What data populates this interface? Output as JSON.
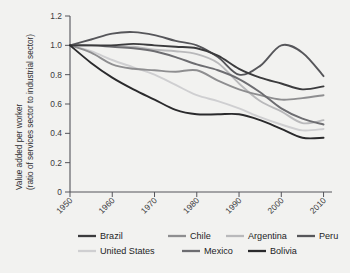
{
  "chart_data": {
    "type": "line",
    "title": "",
    "xlabel": "",
    "ylabel": "Value added per worker\n(ratio of services sector to industrial sector)",
    "ylabel_line1": "Value added per worker",
    "ylabel_line2": "(ratio of services sector to industrial sector)",
    "xlim": [
      1950,
      2012
    ],
    "ylim": [
      0,
      1.2
    ],
    "grid": false,
    "legend_position": "bottom",
    "xticks": [
      "1950",
      "1960",
      "1970",
      "1980",
      "1990",
      "2000",
      "2010"
    ],
    "xtick_values": [
      1950,
      1960,
      1970,
      1980,
      1990,
      2000,
      2010
    ],
    "yticks": [
      "0",
      "0.2",
      "0.4",
      "0.6",
      "0.8",
      "1.0",
      "1.2"
    ],
    "ytick_values": [
      0,
      0.2,
      0.4,
      0.6,
      0.8,
      1.0,
      1.2
    ],
    "series": [
      {
        "name": "Brazil",
        "color": "#3b3b3d",
        "x": [
          1950,
          1955,
          1960,
          1965,
          1970,
          1975,
          1980,
          1985,
          1990,
          1995,
          2000,
          2005,
          2010
        ],
        "values": [
          1.0,
          1.0,
          1.0,
          1.01,
          1.0,
          0.99,
          0.98,
          0.93,
          0.84,
          0.78,
          0.74,
          0.7,
          0.72
        ]
      },
      {
        "name": "Chile",
        "color": "#8e8e90",
        "x": [
          1950,
          1955,
          1960,
          1965,
          1970,
          1975,
          1980,
          1985,
          1990,
          1995,
          2000,
          2005,
          2010
        ],
        "values": [
          1.0,
          0.95,
          0.87,
          0.84,
          0.83,
          0.82,
          0.83,
          0.76,
          0.7,
          0.66,
          0.63,
          0.64,
          0.66
        ]
      },
      {
        "name": "Argentina",
        "color": "#b9b9bb",
        "x": [
          1960,
          1965,
          1970,
          1975,
          1980,
          1985,
          1990,
          1995,
          2000,
          2005,
          2010
        ],
        "values": [
          1.0,
          0.99,
          0.97,
          0.96,
          0.94,
          0.88,
          0.74,
          0.62,
          0.55,
          0.47,
          0.49
        ]
      },
      {
        "name": "Peru",
        "color": "#56565a",
        "x": [
          1950,
          1955,
          1960,
          1965,
          1970,
          1975,
          1980,
          1985,
          1990,
          1995,
          2000,
          2005,
          2010
        ],
        "values": [
          1.0,
          1.04,
          1.08,
          1.09,
          1.07,
          1.03,
          1.0,
          0.92,
          0.8,
          0.86,
          1.0,
          0.95,
          0.79
        ]
      },
      {
        "name": "United States",
        "color": "#cfcfd1",
        "x": [
          1950,
          1955,
          1960,
          1965,
          1970,
          1975,
          1980,
          1985,
          1990,
          1995,
          2000,
          2005,
          2010
        ],
        "values": [
          1.0,
          0.96,
          0.9,
          0.85,
          0.8,
          0.73,
          0.66,
          0.62,
          0.57,
          0.51,
          0.46,
          0.42,
          0.43
        ]
      },
      {
        "name": "Mexico",
        "color": "#6d6d71",
        "x": [
          1950,
          1955,
          1960,
          1965,
          1970,
          1975,
          1980,
          1985,
          1990,
          1995,
          2000,
          2005,
          2010
        ],
        "values": [
          1.0,
          1.0,
          0.99,
          0.98,
          0.96,
          0.92,
          0.87,
          0.83,
          0.77,
          0.68,
          0.57,
          0.5,
          0.46
        ]
      },
      {
        "name": "Bolivia",
        "color": "#2a2a2c",
        "x": [
          1950,
          1955,
          1960,
          1965,
          1970,
          1975,
          1980,
          1985,
          1990,
          1995,
          2000,
          2005,
          2010
        ],
        "values": [
          1.0,
          0.88,
          0.78,
          0.7,
          0.63,
          0.56,
          0.53,
          0.53,
          0.53,
          0.49,
          0.43,
          0.37,
          0.37
        ]
      }
    ]
  },
  "legend": {
    "entries": [
      {
        "label": "Brazil",
        "color": "#3b3b3d"
      },
      {
        "label": "Chile",
        "color": "#8e8e90"
      },
      {
        "label": "Argentina",
        "color": "#b9b9bb"
      },
      {
        "label": "Peru",
        "color": "#56565a"
      },
      {
        "label": "United States",
        "color": "#cfcfd1"
      },
      {
        "label": "Mexico",
        "color": "#6d6d71"
      },
      {
        "label": "Bolivia",
        "color": "#2a2a2c"
      }
    ]
  },
  "style": {
    "background": "#f2f2f0",
    "axis_color": "#54545a",
    "text_color": "#2e2e30"
  }
}
